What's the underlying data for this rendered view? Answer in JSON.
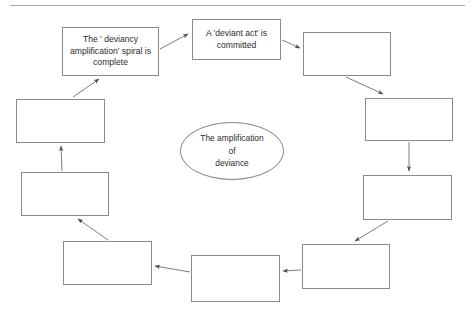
{
  "page": {
    "line_color": "#a9a9a9",
    "box_border_color": "#8a8a8a",
    "arrow_color": "#6e6e6e",
    "text_color": "#2b2b2b",
    "background": "#ffffff"
  },
  "center": {
    "label": "The amplification of deviance",
    "line1": "The amplification",
    "line2": "of",
    "line3": "deviance"
  },
  "nodes": [
    {
      "id": "node-1",
      "label": "A 'deviant act' is committed",
      "filled": true,
      "x": 192,
      "y": 19,
      "w": 89,
      "h": 41
    },
    {
      "id": "node-2",
      "label": "",
      "filled": false,
      "x": 303,
      "y": 32,
      "w": 88,
      "h": 44
    },
    {
      "id": "node-3",
      "label": "",
      "filled": false,
      "x": 365,
      "y": 98,
      "w": 88,
      "h": 43
    },
    {
      "id": "node-4",
      "label": "",
      "filled": false,
      "x": 363,
      "y": 175,
      "w": 89,
      "h": 45
    },
    {
      "id": "node-5",
      "label": "",
      "filled": false,
      "x": 302,
      "y": 244,
      "w": 88,
      "h": 45
    },
    {
      "id": "node-6",
      "label": "",
      "filled": false,
      "x": 191,
      "y": 255,
      "w": 89,
      "h": 47
    },
    {
      "id": "node-7",
      "label": "",
      "filled": false,
      "x": 63,
      "y": 241,
      "w": 89,
      "h": 44
    },
    {
      "id": "node-8",
      "label": "",
      "filled": false,
      "x": 21,
      "y": 172,
      "w": 88,
      "h": 44
    },
    {
      "id": "node-9",
      "label": "",
      "filled": false,
      "x": 16,
      "y": 99,
      "w": 89,
      "h": 44
    },
    {
      "id": "node-10",
      "label": "The ' deviancy amplification' spiral is complete",
      "filled": true,
      "x": 62,
      "y": 27,
      "w": 97,
      "h": 49
    }
  ],
  "oval": {
    "x": 180,
    "y": 122,
    "w": 104,
    "h": 58
  },
  "arrows": [
    {
      "id": "arrow-10-to-1",
      "from": "node-10",
      "to": "node-1",
      "d": "M 160 49 L 188 34"
    },
    {
      "id": "arrow-1-to-2",
      "from": "node-1",
      "to": "node-2",
      "d": "M 282 40 L 300 48"
    },
    {
      "id": "arrow-2-to-3",
      "from": "node-2",
      "to": "node-3",
      "d": "M 346 77 L 383 94"
    },
    {
      "id": "arrow-3-to-4",
      "from": "node-3",
      "to": "node-4",
      "d": "M 409 142 L 409 171"
    },
    {
      "id": "arrow-4-to-5",
      "from": "node-4",
      "to": "node-5",
      "d": "M 388 221 L 355 241"
    },
    {
      "id": "arrow-5-to-6",
      "from": "node-5",
      "to": "node-6",
      "d": "M 301 270 L 283 271"
    },
    {
      "id": "arrow-6-to-7",
      "from": "node-6",
      "to": "node-7",
      "d": "M 190 272 L 155 266"
    },
    {
      "id": "arrow-7-to-8",
      "from": "node-7",
      "to": "node-8",
      "d": "M 108 240 L 78 219"
    },
    {
      "id": "arrow-8-to-9",
      "from": "node-8",
      "to": "node-9",
      "d": "M 62 171 L 61 146"
    },
    {
      "id": "arrow-9-to-10",
      "from": "node-9",
      "to": "node-10",
      "d": "M 73 97 L 99 79"
    }
  ]
}
